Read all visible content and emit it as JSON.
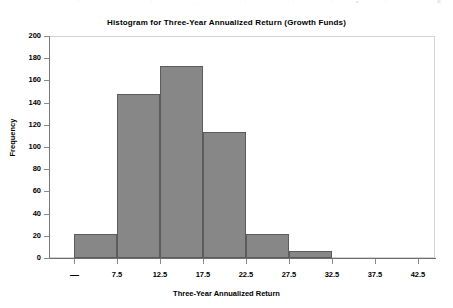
{
  "top_bleed": {
    "visible": true,
    "fragments": [
      "‘",
      "·",
      ".",
      "·",
      "·",
      "·",
      "•",
      "·",
      "✕"
    ]
  },
  "chart_data": {
    "type": "bar",
    "title": "Histogram for Three-Year Annualized Return (Growth Funds)",
    "xlabel": "Three-Year Annualized Return",
    "ylabel": "Frequency",
    "grid": false,
    "legend": null,
    "ylim": [
      0,
      200
    ],
    "yticks": [
      0,
      20,
      40,
      60,
      80,
      100,
      120,
      140,
      160,
      180,
      200
    ],
    "ytick_labels": [
      "0",
      "20",
      "40",
      "60",
      "80",
      "100",
      "120",
      "140",
      "160",
      "180",
      "200"
    ],
    "xtick_labels": [
      "—",
      "7.5",
      "12.5",
      "17.5",
      "22.5",
      "27.5",
      "32.5",
      "37.5",
      "42.5"
    ],
    "bin_edges": [
      "—",
      "7.5",
      "12.5",
      "17.5",
      "22.5",
      "27.5",
      "32.5"
    ],
    "categories": [
      "2.5-7.5",
      "7.5-12.5",
      "12.5-17.5",
      "17.5-22.5",
      "22.5-27.5",
      "27.5-32.5"
    ],
    "values": [
      22,
      148,
      173,
      114,
      22,
      6
    ],
    "bar_color": "#878787",
    "bar_edge_color": "#5c5c5c",
    "frame_color": "#d2d2d2",
    "axis_color": "#7a7a7a"
  }
}
